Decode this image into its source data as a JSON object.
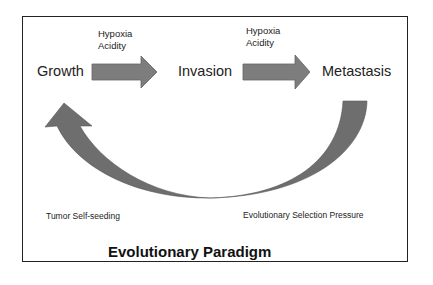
{
  "diagram": {
    "title": "Evolutionary Paradigm",
    "stages": [
      {
        "label": "Growth"
      },
      {
        "label": "Invasion"
      },
      {
        "label": "Metastasis"
      }
    ],
    "transitions": [
      {
        "from": "Growth",
        "to": "Invasion",
        "conditions": [
          "Hypoxia",
          "Acidity"
        ]
      },
      {
        "from": "Invasion",
        "to": "Metastasis",
        "conditions": [
          "Hypoxia",
          "Acidity"
        ]
      }
    ],
    "feedback": {
      "from": "Metastasis",
      "to": "Growth",
      "left_label": "Tumor Self-seeding",
      "right_label": "Evolutionary Selection Pressure"
    },
    "colors": {
      "arrow_fill": "#7a7a7a",
      "arrow_stroke": "#5a5a5a",
      "border": "#222222"
    }
  }
}
